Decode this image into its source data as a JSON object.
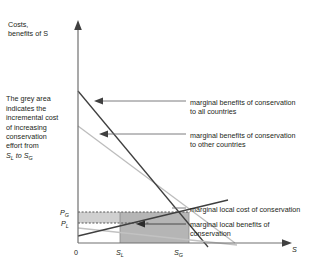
{
  "figure": {
    "axes": {
      "y_label": "Costs,\nbenefits of S",
      "x_axis_label": "S",
      "x_ticks": [
        {
          "name": "origin",
          "label": "0"
        },
        {
          "name": "s-local",
          "label": "S",
          "sub": "L"
        },
        {
          "name": "s-global",
          "label": "S",
          "sub": "G"
        }
      ],
      "y_ticks": [
        {
          "name": "price-global",
          "label": "P",
          "sub": "G"
        },
        {
          "name": "price-local",
          "label": "P",
          "sub": "L"
        }
      ]
    },
    "note": "The grey area indicates the incremental cost of increasing conservation effort from Sₗ to Sɢ",
    "note_lines": [
      "The grey area",
      "indicates the",
      "incremental cost",
      "of increasing",
      "conservation",
      "effort from"
    ],
    "note_last_line": {
      "prefix": "",
      "a": "S",
      "a_sub": "L",
      "mid": " to ",
      "b": "S",
      "b_sub": "G"
    },
    "annotations": [
      {
        "name": "marginal-benefits-all",
        "text": "marginal benefits of conservation\nto all countries"
      },
      {
        "name": "marginal-benefits-other",
        "text": "marginal benefits of conservation\nto other countries"
      },
      {
        "name": "marginal-local-cost",
        "text": "marginal local cost of conservation"
      },
      {
        "name": "marginal-local-benefits",
        "text": "marginal local benefits of\nconservation"
      }
    ],
    "colors": {
      "axis": "#6d6e70",
      "line_dark": "#3b3b3b",
      "line_light": "#b9bbbd",
      "shade_dark": "#b3b3b3",
      "shade_light": "#cccccc",
      "text": "#231f20",
      "leader": "#6d6e70"
    }
  },
  "chart_data": {
    "type": "line",
    "title": "",
    "xlabel": "S",
    "ylabel": "Costs, benefits of S",
    "xlim": [
      0,
      100
    ],
    "ylim": [
      0,
      100
    ],
    "grid": false,
    "legend": "annotations-with-leader-lines",
    "xticks": [
      "0",
      "S_L",
      "S_G"
    ],
    "yticks": [
      "P_L",
      "P_G"
    ],
    "series": [
      {
        "name": "marginal benefits of conservation to all countries",
        "color": "#3b3b3b",
        "points": [
          [
            0,
            76
          ],
          [
            77,
            0
          ]
        ]
      },
      {
        "name": "marginal benefits of conservation to other countries",
        "color": "#b9bbbd",
        "points": [
          [
            0,
            54
          ],
          [
            86,
            0
          ]
        ]
      },
      {
        "name": "marginal local cost of conservation",
        "color": "#3b3b3b",
        "points": [
          [
            0,
            6
          ],
          [
            100,
            30
          ]
        ]
      },
      {
        "name": "marginal local benefits of conservation",
        "color": "#b9bbbd",
        "points": [
          [
            0,
            13
          ],
          [
            100,
            0
          ]
        ]
      }
    ],
    "regions": [
      {
        "name": "incremental-cost-grey-area",
        "type": "rect",
        "x": [
          "S_L",
          "S_G"
        ],
        "y": [
          0,
          "P_G"
        ],
        "fill": "#b3b3b3"
      },
      {
        "name": "band-to-p-global",
        "type": "rect",
        "x": [
          "0",
          "S_G"
        ],
        "y": [
          "P_L",
          "P_G"
        ],
        "fill": "#cccccc",
        "dashed_top": true
      }
    ]
  }
}
